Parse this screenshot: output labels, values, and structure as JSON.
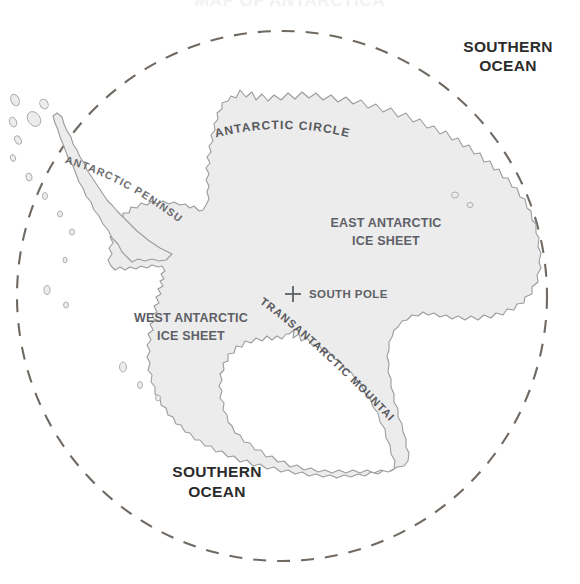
{
  "map": {
    "title": "MAP OF ANTARCTICA",
    "labels": {
      "antarctic_circle": "ANTARCTIC CIRCLE",
      "southern_ocean_top": "SOUTHERN",
      "southern_ocean_top_2": "OCEAN",
      "southern_ocean_bottom": "SOUTHERN",
      "southern_ocean_bottom_2": "OCEAN",
      "east_ice_sheet_1": "EAST ANTARCTIC",
      "east_ice_sheet_2": "ICE SHEET",
      "west_ice_sheet_1": "WEST ANTARCTIC",
      "west_ice_sheet_2": "ICE SHEET",
      "south_pole": "SOUTH POLE",
      "antarctic_peninsula": "ANTARCTIC PENINSULA",
      "transantarctic_mountains": "TRANSANTARCTIC MOUNTAINS"
    },
    "colors": {
      "land_fill": "#ececec",
      "coastline": "#9b9b9b",
      "circle_dash": "#6f6962",
      "label_gray": "#5d6066",
      "label_dark": "#2b2b2b",
      "background": "#ffffff"
    },
    "geometry": {
      "circle_center_x": 282,
      "circle_center_y": 296,
      "circle_radius": 265,
      "south_pole_x": 293,
      "south_pole_y": 294
    }
  }
}
